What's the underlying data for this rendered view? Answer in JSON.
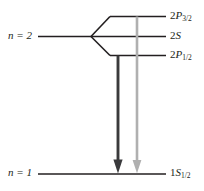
{
  "figure": {
    "type": "energy-level-diagram",
    "background_color": "#ffffff",
    "line_color": "#231f20",
    "transition_colors": {
      "primary": "#3a3a3c",
      "secondary": "#b0b0b0"
    }
  },
  "left_labels": [
    {
      "id": "n2",
      "n_symbol": "n",
      "equals": " = ",
      "value": "2",
      "text": "n = 2"
    },
    {
      "id": "n1",
      "n_symbol": "n",
      "equals": " = ",
      "value": "1",
      "text": "n = 1"
    }
  ],
  "levels": [
    {
      "id": "2p32",
      "term": "2P",
      "p_letter": "P",
      "prefix": "2",
      "subscript": "3/2",
      "text": "2P3/2",
      "energy_label": "2P_{3/2}"
    },
    {
      "id": "2s",
      "term": "2S",
      "p_letter": "S",
      "prefix": "2",
      "subscript": "",
      "text": "2S",
      "energy_label": "2S"
    },
    {
      "id": "2p12",
      "term": "2P",
      "p_letter": "P",
      "prefix": "2",
      "subscript": "1/2",
      "text": "2P1/2",
      "energy_label": "2P_{1/2}"
    },
    {
      "id": "1s12",
      "term": "1S",
      "p_letter": "S",
      "prefix": "1",
      "subscript": "1/2",
      "text": "1S1/2",
      "energy_label": "1S_{1/2}"
    }
  ],
  "transitions": [
    {
      "id": "transition-dark",
      "from": "2p12",
      "to": "1s12",
      "color": "#3a3a3c",
      "direction": "down"
    },
    {
      "id": "transition-light",
      "from": "2p32",
      "to": "1s12",
      "color": "#b0b0b0",
      "direction": "down"
    }
  ]
}
